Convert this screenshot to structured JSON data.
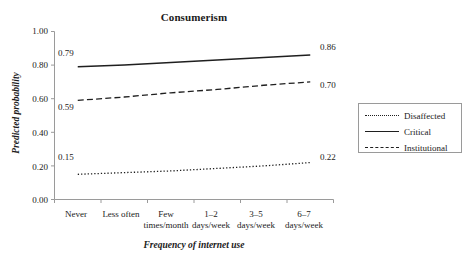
{
  "chart_data": {
    "type": "line",
    "title": "Consumerism",
    "xlabel": "Frequency of internet use",
    "ylabel": "Predicted probability",
    "categories": [
      "Never",
      "Less often",
      "Few times/month",
      "1–2 days/week",
      "3–5 days/week",
      "6–7 days/week"
    ],
    "category_lines": [
      [
        "Never",
        ""
      ],
      [
        "Less often",
        ""
      ],
      [
        "Few",
        "times/month"
      ],
      [
        "1–2",
        "days/week"
      ],
      [
        "3–5",
        "days/week"
      ],
      [
        "6–7",
        "days/week"
      ]
    ],
    "ylim": [
      0.0,
      1.0
    ],
    "yticks": [
      "0.00",
      "0.20",
      "0.40",
      "0.60",
      "0.80",
      "1.00"
    ],
    "ytick_values": [
      0.0,
      0.2,
      0.4,
      0.6,
      0.8,
      1.0
    ],
    "grid": false,
    "legend_position": "right-outside",
    "series": [
      {
        "name": "Disaffected",
        "style": "dotted",
        "color": "#1f1f1f",
        "values": [
          0.15,
          0.16,
          0.17,
          0.185,
          0.2,
          0.22
        ],
        "start_label": "0.15",
        "end_label": "0.22"
      },
      {
        "name": "Critical",
        "style": "solid",
        "color": "#1f1f1f",
        "values": [
          0.79,
          0.8,
          0.815,
          0.83,
          0.845,
          0.86
        ],
        "start_label": "0.79",
        "end_label": "0.86"
      },
      {
        "name": "Institutional",
        "style": "dashed",
        "color": "#1f1f1f",
        "values": [
          0.59,
          0.61,
          0.635,
          0.655,
          0.68,
          0.7
        ],
        "start_label": "0.59",
        "end_label": "0.70"
      }
    ],
    "axis_color": "#9a9a9a"
  },
  "legend": {
    "entries": [
      {
        "label": "Disaffected",
        "style": "dotted"
      },
      {
        "label": "Critical",
        "style": "solid"
      },
      {
        "label": "Institutional",
        "style": "dashed"
      }
    ]
  }
}
